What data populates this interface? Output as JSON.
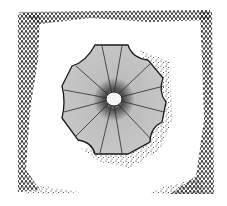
{
  "illustration": {
    "subject": "stippled ink drawing of an eight-lobed star shape inside a hatched square frame",
    "colors": {
      "background": "#ffffff",
      "ink": "#1a1a1a",
      "facet_fill": "#bdbdbd",
      "facet_shadow": "#8a8a8a",
      "center_highlight": "#f4f4f4"
    }
  }
}
